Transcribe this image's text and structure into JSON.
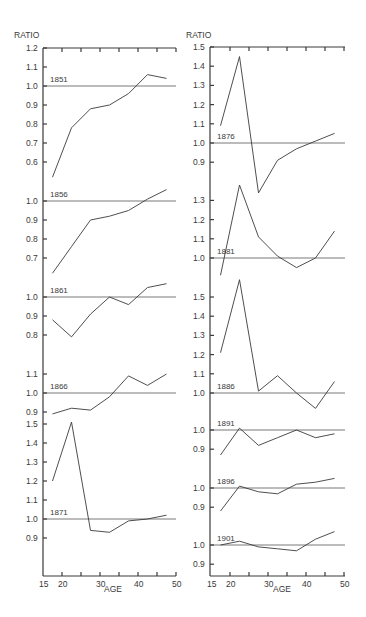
{
  "chart_data": [
    {
      "type": "line",
      "column": "left",
      "ylabel": "RATIO",
      "xlabel": "AGE",
      "x_ticks": [
        "15",
        "20",
        "30",
        "40",
        "50"
      ],
      "xlim": [
        15,
        50
      ],
      "reference_line": 1.0,
      "panels": [
        {
          "label": "1851",
          "x": [
            17.5,
            22.5,
            27.5,
            32.5,
            37.5,
            42.5,
            47.5
          ],
          "values": [
            0.52,
            0.78,
            0.88,
            0.9,
            0.96,
            1.06,
            1.04
          ],
          "y_ticks": [
            "1.2",
            "1.1",
            "1.0",
            "0.9",
            "0.8",
            "0.7",
            "0.6"
          ]
        },
        {
          "label": "1856",
          "x": [
            17.5,
            22.5,
            27.5,
            32.5,
            37.5,
            42.5,
            47.5
          ],
          "values": [
            0.62,
            0.76,
            0.9,
            0.92,
            0.95,
            1.01,
            1.06
          ],
          "y_ticks": [
            "1.0",
            "0.9",
            "0.8",
            "0.7"
          ]
        },
        {
          "label": "1861",
          "x": [
            17.5,
            22.5,
            27.5,
            32.5,
            37.5,
            42.5,
            47.5
          ],
          "values": [
            0.88,
            0.79,
            0.91,
            1.0,
            0.96,
            1.05,
            1.07
          ],
          "y_ticks": [
            "1.0",
            "0.9",
            "0.8"
          ]
        },
        {
          "label": "1866",
          "x": [
            17.5,
            22.5,
            27.5,
            32.5,
            37.5,
            42.5,
            47.5
          ],
          "values": [
            0.89,
            0.92,
            0.91,
            0.98,
            1.09,
            1.04,
            1.1
          ],
          "y_ticks": [
            "1.1",
            "1.0",
            "0.9"
          ]
        },
        {
          "label": "1871",
          "x": [
            17.5,
            22.5,
            27.5,
            32.5,
            37.5,
            42.5,
            47.5
          ],
          "values": [
            1.2,
            1.51,
            0.94,
            0.93,
            0.99,
            1.0,
            1.02
          ],
          "y_ticks": [
            "1.5",
            "1.4",
            "1.3",
            "1.2",
            "1.1",
            "1.0",
            "0.9"
          ]
        }
      ]
    },
    {
      "type": "line",
      "column": "right",
      "ylabel": "RATIO",
      "xlabel": "AGE",
      "x_ticks": [
        "15",
        "20",
        "30",
        "40",
        "50"
      ],
      "xlim": [
        15,
        50
      ],
      "reference_line": 1.0,
      "panels": [
        {
          "label": "1876",
          "x": [
            17.5,
            22.5,
            27.5,
            32.5,
            37.5,
            42.5,
            47.5
          ],
          "values": [
            1.09,
            1.45,
            0.74,
            0.91,
            0.97,
            1.01,
            1.05
          ],
          "y_ticks": [
            "1.5",
            "1.4",
            "1.3",
            "1.2",
            "1.1",
            "1.0",
            "0.9"
          ]
        },
        {
          "label": "1881",
          "x": [
            17.5,
            22.5,
            27.5,
            32.5,
            37.5,
            42.5,
            47.5
          ],
          "values": [
            0.91,
            1.38,
            1.11,
            1.01,
            0.95,
            1.0,
            1.14
          ],
          "y_ticks": [
            "1.3",
            "1.2",
            "1.1",
            "1.0"
          ]
        },
        {
          "label": "1886",
          "x": [
            17.5,
            22.5,
            27.5,
            32.5,
            37.5,
            42.5,
            47.5
          ],
          "values": [
            1.21,
            1.59,
            1.01,
            1.09,
            1.0,
            0.92,
            1.06
          ],
          "y_ticks": [
            "1.5",
            "1.4",
            "1.3",
            "1.2",
            "1.1",
            "1.0"
          ]
        },
        {
          "label": "1891",
          "x": [
            17.5,
            22.5,
            27.5,
            32.5,
            37.5,
            42.5,
            47.5
          ],
          "values": [
            0.87,
            1.01,
            0.92,
            0.96,
            1.0,
            0.96,
            0.98
          ],
          "y_ticks": [
            "1.0",
            "0.9"
          ]
        },
        {
          "label": "1896",
          "x": [
            17.5,
            22.5,
            27.5,
            32.5,
            37.5,
            42.5,
            47.5
          ],
          "values": [
            0.88,
            1.01,
            0.98,
            0.97,
            1.02,
            1.03,
            1.05
          ],
          "y_ticks": [
            "1.0",
            "0.9"
          ]
        },
        {
          "label": "1901",
          "x": [
            17.5,
            22.5,
            27.5,
            32.5,
            37.5,
            42.5,
            47.5
          ],
          "values": [
            1.0,
            1.02,
            0.99,
            0.98,
            0.97,
            1.03,
            1.07
          ],
          "y_ticks": [
            "1.0",
            "0.9"
          ]
        }
      ]
    }
  ],
  "labels": {
    "ratio_left": "RATIO",
    "ratio_right": "RATIO",
    "age_left": "AGE",
    "age_right": "AGE"
  }
}
